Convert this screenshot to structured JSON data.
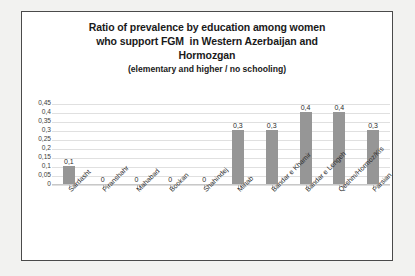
{
  "chart_data": {
    "type": "bar",
    "title": "Ratio of prevalence by education among women who support FGM  in Western Azerbaijan and Hormozgan",
    "title_lines": [
      "Ratio of prevalence by education among women",
      "who support FGM  in Western Azerbaijan and",
      "Hormozgan"
    ],
    "subtitle": "(elementary and higher / no schooling)",
    "categories": [
      "Sardasht",
      "Piranshahr",
      "Mahabad",
      "Bookan",
      "Shahindej",
      "Minab",
      "Bandar e Khamir",
      "Bandar e Lengeh",
      "Qeshm/Hormoz/Kis",
      "Parsian"
    ],
    "values": [
      0.1,
      0,
      0,
      0,
      0,
      0.3,
      0.3,
      0.4,
      0.4,
      0.3
    ],
    "data_labels": [
      "0,1",
      "0",
      "0",
      "0",
      "0",
      "0,3",
      "0,3",
      "0,4",
      "0,4",
      "0,3"
    ],
    "ytick_labels": [
      "0,45",
      "0,4",
      "0,35",
      "0,3",
      "0,25",
      "0,2",
      "0,15",
      "0,1",
      "0,05",
      "0"
    ],
    "ytick_values": [
      0.45,
      0.4,
      0.35,
      0.3,
      0.25,
      0.2,
      0.15,
      0.1,
      0.05,
      0
    ],
    "ylim": [
      0,
      0.45
    ],
    "xlabel": "",
    "ylabel": "",
    "grid": true,
    "legend": false,
    "bar_color": "#969696",
    "decimal_separator": ","
  }
}
